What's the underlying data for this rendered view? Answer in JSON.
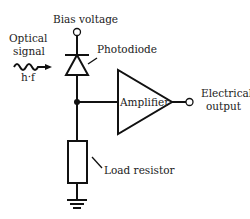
{
  "diagram": {
    "labels": {
      "bias_voltage": "Bias voltage",
      "optical_signal_line1": "Optical",
      "optical_signal_line2": "signal",
      "photon_energy": "h·f",
      "photodiode": "Photodiode",
      "amplifier": "Amplifier",
      "electrical_output_line1": "Electrical",
      "electrical_output_line2": "output",
      "load_resistor": "Load resistor"
    },
    "components": [
      {
        "id": "bias-terminal",
        "type": "terminal"
      },
      {
        "id": "photodiode",
        "type": "diode"
      },
      {
        "id": "amplifier",
        "type": "op-amp"
      },
      {
        "id": "output-terminal",
        "type": "terminal"
      },
      {
        "id": "load-resistor",
        "type": "resistor"
      },
      {
        "id": "ground",
        "type": "ground"
      }
    ],
    "colors": {
      "line": "#111111",
      "text": "#222222",
      "background": "#ffffff"
    }
  }
}
